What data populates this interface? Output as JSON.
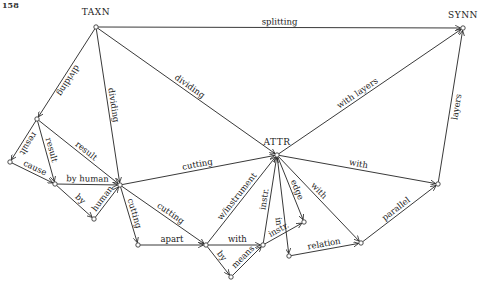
{
  "page_number": "158",
  "nodes": [
    {
      "id": "TAXN",
      "label": "TAXN"
    },
    {
      "id": "SYNN",
      "label": "SYNN"
    },
    {
      "id": "ATTR",
      "label": "ATTR"
    },
    {
      "id": "n_a",
      "label": ""
    },
    {
      "id": "n_b",
      "label": ""
    },
    {
      "id": "n_c",
      "label": ""
    },
    {
      "id": "n_d",
      "label": ""
    },
    {
      "id": "n_e",
      "label": ""
    },
    {
      "id": "n_f",
      "label": ""
    },
    {
      "id": "n_g",
      "label": ""
    },
    {
      "id": "n_h",
      "label": ""
    },
    {
      "id": "n_i",
      "label": ""
    },
    {
      "id": "n_j",
      "label": ""
    },
    {
      "id": "n_k",
      "label": ""
    },
    {
      "id": "n_l",
      "label": ""
    },
    {
      "id": "n_m",
      "label": ""
    }
  ],
  "edges": [
    {
      "from": "TAXN",
      "to": "SYNN",
      "label": "splitting"
    },
    {
      "from": "TAXN",
      "to": "n_a",
      "label": "dividing"
    },
    {
      "from": "TAXN",
      "to": "n_e",
      "label": "dividing"
    },
    {
      "from": "TAXN",
      "to": "ATTR",
      "label": "dividing"
    },
    {
      "from": "n_a",
      "to": "n_b",
      "label": "result"
    },
    {
      "from": "n_a",
      "to": "n_c",
      "label": "result"
    },
    {
      "from": "n_a",
      "to": "n_e",
      "label": "result"
    },
    {
      "from": "n_b",
      "to": "n_c",
      "label": "cause"
    },
    {
      "from": "n_c",
      "to": "n_e",
      "label": "by human"
    },
    {
      "from": "n_c",
      "to": "n_d",
      "label": "by"
    },
    {
      "from": "n_d",
      "to": "n_e",
      "label": "human"
    },
    {
      "from": "n_e",
      "to": "ATTR",
      "label": "cutting"
    },
    {
      "from": "n_e",
      "to": "n_f",
      "label": "cutting"
    },
    {
      "from": "n_e",
      "to": "n_g",
      "label": "cutting"
    },
    {
      "from": "n_f",
      "to": "n_g",
      "label": "apart"
    },
    {
      "from": "n_g",
      "to": "ATTR",
      "label": "w/instrument"
    },
    {
      "from": "n_g",
      "to": "n_i",
      "label": "with"
    },
    {
      "from": "n_g",
      "to": "n_h",
      "label": "by"
    },
    {
      "from": "n_h",
      "to": "n_i",
      "label": "means"
    },
    {
      "from": "n_i",
      "to": "ATTR",
      "label": "instr."
    },
    {
      "from": "n_i",
      "to": "n_j",
      "label": "instr."
    },
    {
      "from": "ATTR",
      "to": "n_j",
      "label": "edge"
    },
    {
      "from": "ATTR",
      "to": "n_k",
      "label": "in"
    },
    {
      "from": "ATTR",
      "to": "n_l",
      "label": "with"
    },
    {
      "from": "n_k",
      "to": "n_l",
      "label": "relation"
    },
    {
      "from": "n_l",
      "to": "n_m",
      "label": "parallel"
    },
    {
      "from": "ATTR",
      "to": "n_m",
      "label": "with"
    },
    {
      "from": "ATTR",
      "to": "SYNN",
      "label": "with layers"
    },
    {
      "from": "n_m",
      "to": "SYNN",
      "label": "layers"
    }
  ]
}
